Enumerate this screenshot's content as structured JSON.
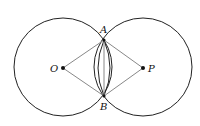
{
  "diagram": {
    "points": {
      "O": {
        "label": "O",
        "x": 63,
        "y": 68
      },
      "P": {
        "label": "P",
        "x": 143,
        "y": 68
      },
      "A": {
        "label": "A",
        "x": 104,
        "y": 40
      },
      "B": {
        "label": "B",
        "x": 104,
        "y": 96
      }
    },
    "circles": [
      {
        "center": "O",
        "r": 49
      },
      {
        "center": "P",
        "r": 49
      }
    ],
    "segments": [
      [
        "O",
        "A"
      ],
      [
        "O",
        "B"
      ],
      [
        "P",
        "A"
      ],
      [
        "P",
        "B"
      ],
      [
        "A",
        "B"
      ]
    ],
    "arcs": [
      "inner arc AB of circle O",
      "inner arc AB of circle P"
    ],
    "colors": {
      "circle": "#222222",
      "segment": "#888888",
      "point": "#111111"
    }
  }
}
